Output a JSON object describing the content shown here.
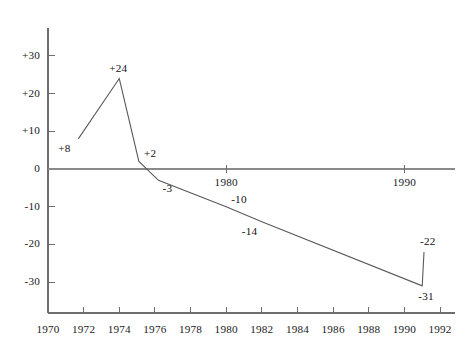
{
  "chart_data": {
    "type": "line",
    "title": "",
    "subtitle": "",
    "xlabel": "",
    "ylabel": "",
    "xlim": [
      1970,
      1992
    ],
    "ylim": [
      -35,
      35
    ],
    "grid": false,
    "legend": null,
    "x_ticks": [
      "1970",
      "1972",
      "1974",
      "1976",
      "1978",
      "1980",
      "1982",
      "1984",
      "1986",
      "1988",
      "1990",
      "1992"
    ],
    "x_tick_values": [
      1970,
      1972,
      1974,
      1976,
      1978,
      1980,
      1982,
      1984,
      1986,
      1988,
      1990,
      1992
    ],
    "y_ticks": [
      "+30",
      "+20",
      "+10",
      "0",
      "-10",
      "-20",
      "-30"
    ],
    "y_tick_values": [
      30,
      20,
      10,
      0,
      -10,
      -20,
      -30
    ],
    "inline_axis_years": [
      {
        "label": "1980",
        "value": 1980
      },
      {
        "label": "1990",
        "value": 1990
      }
    ],
    "series": [
      {
        "name": "balance",
        "x": [
          1971.7,
          1974.0,
          1975.1,
          1976.2,
          1980.0,
          1982.0,
          1991.0,
          1991.1
        ],
        "values": [
          8,
          24,
          2,
          -3,
          -10,
          -14,
          -31,
          -22
        ],
        "point_labels": [
          "+8",
          "+24",
          "+2",
          "-3",
          "-10",
          "-14",
          "-31",
          "-22"
        ]
      }
    ],
    "annotations": [
      {
        "text": "+8",
        "x": 1971.7,
        "y": 8,
        "anchor": "below-left"
      },
      {
        "text": "+24",
        "x": 1974.0,
        "y": 24,
        "anchor": "above"
      },
      {
        "text": "+2",
        "x": 1975.1,
        "y": 2,
        "anchor": "right"
      },
      {
        "text": "-3",
        "x": 1976.2,
        "y": -3,
        "anchor": "below-right"
      },
      {
        "text": "-10",
        "x": 1980.0,
        "y": -10,
        "anchor": "right"
      },
      {
        "text": "-14",
        "x": 1982.0,
        "y": -14,
        "anchor": "below-left"
      },
      {
        "text": "-31",
        "x": 1991.0,
        "y": -31,
        "anchor": "below"
      },
      {
        "text": "-22",
        "x": 1991.1,
        "y": -22,
        "anchor": "above-left"
      }
    ]
  },
  "geometry": {
    "y_axis_x": 48,
    "zero_y": 169,
    "x_axis_y": 313,
    "px_per_year": 17.82,
    "px_per_unit": 3.77,
    "x_origin_year": 1970,
    "plot_right": 455,
    "y_axis_top": 28
  }
}
